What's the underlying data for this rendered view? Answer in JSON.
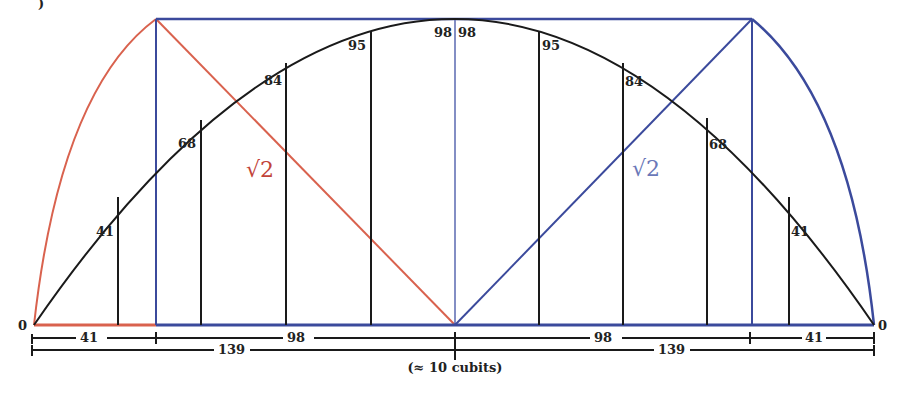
{
  "figure": {
    "corner_fragment": ")",
    "ordinate_labels_left": [
      "41",
      "68",
      "84",
      "95",
      "98"
    ],
    "ordinate_labels_right": [
      "98",
      "95",
      "84",
      "68",
      "41"
    ],
    "end_labels": {
      "left": "0",
      "right": "0"
    },
    "diagonal_labels": {
      "left": "√2",
      "right": "√2"
    },
    "dimensions": {
      "row1": [
        "41",
        "98",
        "98",
        "41"
      ],
      "row2": [
        "139",
        "139"
      ],
      "caption": "(≈ 10 cubits)"
    },
    "colors": {
      "red": "#d9624e",
      "blue": "#3b4a9c",
      "black": "#1a1a1a",
      "blue_label": "#6a78b8",
      "red_label": "#c2443a"
    }
  }
}
